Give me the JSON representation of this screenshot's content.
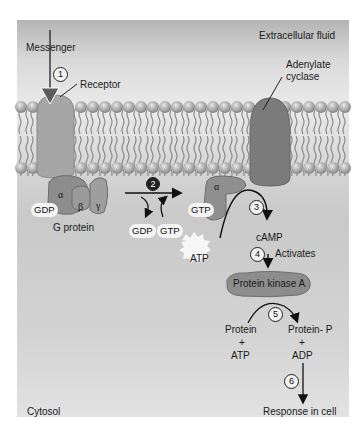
{
  "regions": {
    "extracellular": "Extracellular fluid",
    "cytosol": "Cytosol"
  },
  "labels": {
    "messenger": "Messenger",
    "receptor": "Receptor",
    "adenylate_cyclase_line1": "Adenylate",
    "adenylate_cyclase_line2": "cyclase",
    "g_protein": "G protein",
    "alpha": "α",
    "beta": "β",
    "gamma": "γ",
    "gdp_bound": "GDP",
    "gdp_released": "GDP",
    "gtp_incoming": "GTP",
    "gtp_bound": "GTP",
    "alpha_active": "α",
    "atp": "ATP",
    "camp": "cAMP",
    "activates": "Activates",
    "protein_kinase_a": "Protein kinase A",
    "substrate_protein": "Protein",
    "substrate_plus": "+",
    "substrate_atp": "ATP",
    "product_protein_p": "Protein-  P",
    "product_plus": "+",
    "product_adp": "ADP",
    "response": "Response in cell"
  },
  "steps": [
    "1",
    "2",
    "3",
    "4",
    "5",
    "6"
  ],
  "colors": {
    "protein_fill": "#8f8f8f",
    "protein_dark": "#6e6e6e",
    "membrane_head": "#a9a9a9",
    "arrow": "#111111"
  }
}
